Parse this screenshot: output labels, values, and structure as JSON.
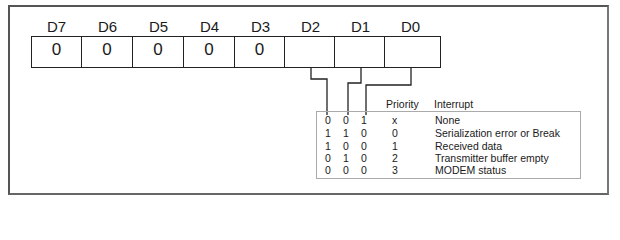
{
  "register": {
    "bits": [
      {
        "label": "D7",
        "value": "0"
      },
      {
        "label": "D6",
        "value": "0"
      },
      {
        "label": "D5",
        "value": "0"
      },
      {
        "label": "D4",
        "value": "0"
      },
      {
        "label": "D3",
        "value": "0"
      },
      {
        "label": "D2",
        "value": ""
      },
      {
        "label": "D1",
        "value": ""
      },
      {
        "label": "D0",
        "value": ""
      }
    ]
  },
  "table": {
    "headers": {
      "priority": "Priority",
      "interrupt": "Interrupt"
    },
    "rows": [
      {
        "d2": "0",
        "d1": "0",
        "d0": "1",
        "priority": "x",
        "interrupt": "None"
      },
      {
        "d2": "1",
        "d1": "1",
        "d0": "0",
        "priority": "0",
        "interrupt": "Serialization error or Break"
      },
      {
        "d2": "1",
        "d1": "0",
        "d0": "0",
        "priority": "1",
        "interrupt": "Received data"
      },
      {
        "d2": "0",
        "d1": "1",
        "d0": "0",
        "priority": "2",
        "interrupt": "Transmitter buffer empty"
      },
      {
        "d2": "0",
        "d1": "0",
        "d0": "0",
        "priority": "3",
        "interrupt": "MODEM status"
      }
    ]
  }
}
